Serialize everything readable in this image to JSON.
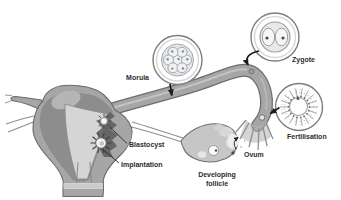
{
  "diagram": {
    "stages": {
      "morula": {
        "label": "Morula"
      },
      "zygote": {
        "label": "Zygote"
      },
      "fertilisation": {
        "label": "Fertilisation"
      },
      "ovum": {
        "label": "Ovum"
      },
      "developing_follicle": {
        "label_line1": "Developing",
        "label_line2": "follicle"
      },
      "blastocyst": {
        "label": "Blastocyst"
      },
      "implantation": {
        "label": "Implantation"
      }
    },
    "colors": {
      "background": "#ffffff",
      "anatomy_gray": "#a6a6a6",
      "anatomy_dark": "#8d8d8d",
      "cavity_light": "#d5d5d5",
      "ovary_fill": "#c6c6c6",
      "outline": "#6b6b6b",
      "inset_ring": "#7d7d7d",
      "villi_dark": "#5f5f5f",
      "label_color": "#2d2d2d",
      "arrow_color": "#1c1c1c"
    }
  }
}
